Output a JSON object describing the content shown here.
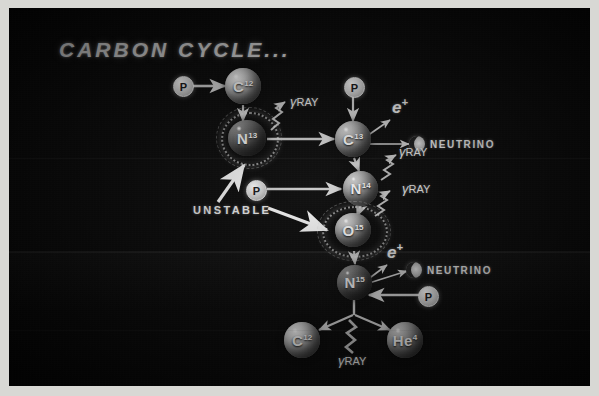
{
  "title": "CARBON CYCLE...",
  "diagram": {
    "name": "carbon-cycle-cno-diagram",
    "nuclei": [
      {
        "id": "c12-top",
        "label": "C",
        "mass": "12",
        "style": "bright",
        "unstable": false,
        "x": 234,
        "y": 68,
        "size": 36
      },
      {
        "id": "n13",
        "label": "N",
        "mass": "13",
        "style": "dark",
        "unstable": true,
        "x": 237,
        "y": 113,
        "size": 38
      },
      {
        "id": "c13",
        "label": "C",
        "mass": "13",
        "style": "mid",
        "unstable": false,
        "x": 335,
        "y": 113,
        "size": 36
      },
      {
        "id": "n14",
        "label": "N",
        "mass": "14",
        "style": "mid",
        "unstable": false,
        "x": 347,
        "y": 162,
        "size": 35
      },
      {
        "id": "o15",
        "label": "O",
        "mass": "15",
        "style": "mid",
        "unstable": true,
        "x": 336,
        "y": 206,
        "size": 36
      },
      {
        "id": "n15",
        "label": "N",
        "mass": "15",
        "style": "dark",
        "unstable": false,
        "x": 337,
        "y": 256,
        "size": 35
      },
      {
        "id": "c12-bot",
        "label": "C",
        "mass": "12",
        "style": "bright",
        "unstable": false,
        "x": 293,
        "y": 313,
        "size": 36
      },
      {
        "id": "he4",
        "label": "He",
        "mass": "4",
        "style": "mid",
        "unstable": false,
        "x": 391,
        "y": 313,
        "size": 36
      }
    ],
    "protons": [
      {
        "id": "proton-into-c12",
        "label": "P",
        "x": 173,
        "y": 77
      },
      {
        "id": "proton-into-c13",
        "label": "P",
        "x": 344,
        "y": 78
      },
      {
        "id": "proton-into-n14",
        "label": "P",
        "x": 246,
        "y": 173
      },
      {
        "id": "proton-into-n15",
        "label": "P",
        "x": 418,
        "y": 277
      }
    ],
    "gamma_rays": [
      {
        "id": "gamma-n13",
        "label": "RAY",
        "symbol": "γ",
        "x": 292,
        "y": 96
      },
      {
        "id": "gamma-n14",
        "label": "RAY",
        "symbol": "γ",
        "x": 400,
        "y": 166
      },
      {
        "id": "gamma-o15",
        "label": "RAY",
        "symbol": "γ",
        "x": 400,
        "y": 203
      },
      {
        "id": "gamma-fission",
        "label": "RAY",
        "symbol": "γ",
        "x": 341,
        "y": 350
      }
    ],
    "positrons": [
      {
        "id": "positron-c13",
        "label": "e",
        "charge": "+",
        "x": 390,
        "y": 97
      },
      {
        "id": "positron-n15",
        "label": "e",
        "charge": "+",
        "x": 385,
        "y": 242
      }
    ],
    "neutrinos": [
      {
        "id": "neutrino-c13",
        "label": "NEUTRINO",
        "x": 408,
        "y": 126
      },
      {
        "id": "neutrino-n15",
        "label": "NEUTRINO",
        "x": 404,
        "y": 252
      }
    ],
    "annotations": [
      {
        "id": "unstable-label",
        "label": "UNSTABLE",
        "x": 193,
        "y": 196
      }
    ]
  },
  "colors": {
    "board": "#050505",
    "print_border": "#d8d8d4",
    "chalk": "#e6e6e6",
    "sphere_bright": "#efefef",
    "sphere_mid": "#c9c9c9",
    "sphere_dark": "#6d6d6d"
  }
}
